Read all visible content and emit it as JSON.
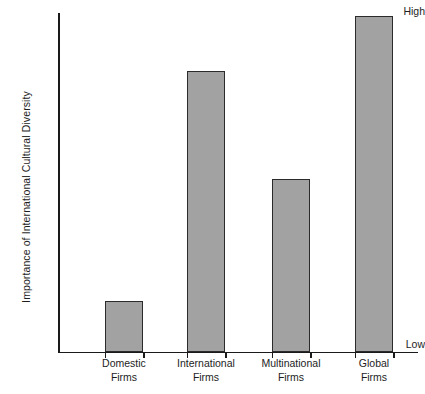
{
  "chart_data": {
    "type": "bar",
    "title": "",
    "subtitle": "",
    "xlabel": "",
    "ylabel": "Importance of International Cultural Diversity",
    "categories": [
      "Domestic Firms",
      "International Firms",
      "Multinational Firms",
      "Global Firms"
    ],
    "category_lines": [
      {
        "line1": "Domestic",
        "line2": "Firms"
      },
      {
        "line1": "International",
        "line2": "Firms"
      },
      {
        "line1": "Multinational",
        "line2": "Firms"
      },
      {
        "line1": "Global",
        "line2": "Firms"
      }
    ],
    "values": [
      15,
      83,
      51,
      99
    ],
    "ylim": [
      0,
      100
    ],
    "ytick_labels": [
      "Low",
      "High"
    ],
    "ytick_values": [
      0,
      100
    ],
    "grid": false,
    "legend": false,
    "legend_position": "none",
    "bar_fill_color": "#a2a2a2",
    "bar_border_color": "#2b2b2b",
    "axis_color": "#1a1a1a",
    "background_color": "#ffffff",
    "text_color": "#1d1d1d",
    "annotations": []
  },
  "axis": {
    "y_high_label": "High",
    "y_low_label": "Low",
    "y_title": "Importance of International Cultural Diversity"
  }
}
